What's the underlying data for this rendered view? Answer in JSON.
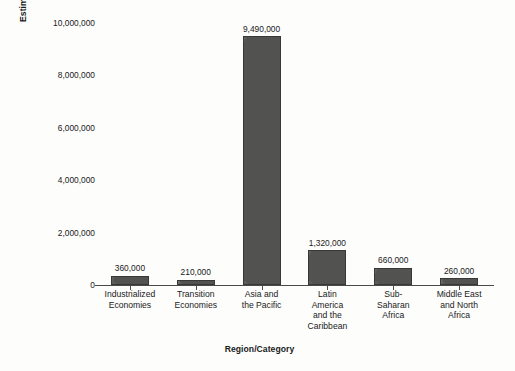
{
  "chart_data": {
    "type": "bar",
    "title": "",
    "xlabel": "Region/Category",
    "ylabel": "Estimated Number of Presons (Rounded Up)",
    "categories": [
      "Industrialized\nEconomies",
      "Transition\nEconomies",
      "Asia and\nthe Pacific",
      "Latin\nAmerica\nand the\nCaribbean",
      "Sub-\nSaharan\nAfrica",
      "Middle East\nand North\nAfrica"
    ],
    "values": [
      360000,
      210000,
      9490000,
      1320000,
      660000,
      260000
    ],
    "value_labels": [
      "360,000",
      "210,000",
      "9,490,000",
      "1,320,000",
      "660,000",
      "260,000"
    ],
    "ylim": [
      0,
      10000000
    ],
    "yticks": [
      0,
      2000000,
      4000000,
      6000000,
      8000000,
      10000000
    ],
    "ytick_labels": [
      "0",
      "2,000,000",
      "4,000,000",
      "6,000,000",
      "8,000,000",
      "10,000,000"
    ],
    "grid": false,
    "legend": null,
    "bar_color": "#5a5a58",
    "bar_border_color": "#38383a",
    "axis_color": "#4a4a48",
    "background_color": "#fdfdfc"
  }
}
